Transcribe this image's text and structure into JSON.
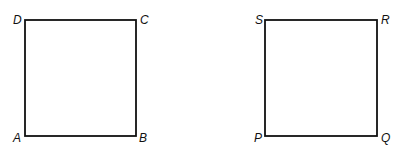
{
  "figures": [
    {
      "name": "square-ABCD",
      "labels": {
        "top_left": "D",
        "top_right": "C",
        "bottom_left": "A",
        "bottom_right": "B"
      }
    },
    {
      "name": "square-PQRS",
      "labels": {
        "top_left": "S",
        "top_right": "R",
        "bottom_left": "P",
        "bottom_right": "Q"
      }
    }
  ],
  "colors": {
    "stroke": "#111111",
    "background": "#ffffff"
  }
}
